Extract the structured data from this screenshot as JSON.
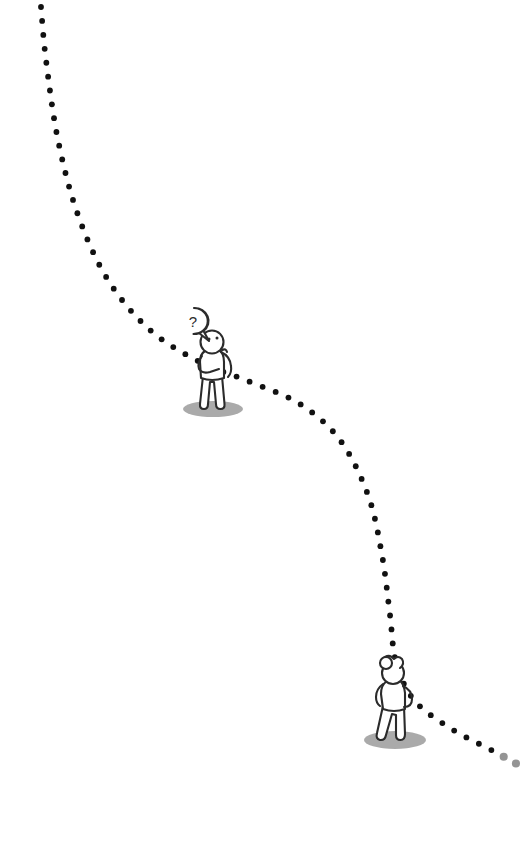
{
  "canvas": {
    "width": 529,
    "height": 849,
    "background_color": "#ffffff"
  },
  "illustration": {
    "title": "Dotted journey path with two stick figures",
    "style": "hand-drawn line art, monochrome",
    "ink_color": "#2b2b2b",
    "dot_color": "#111111",
    "shadow_color": "#8d8d8d"
  },
  "dotted_path": {
    "name": "journey-path",
    "dot_radius": 2.9,
    "dot_spacing": 14,
    "color": "#111111",
    "description": "A dotted trail entering at the top-left, sweeping down and right past a thinking figure, descending steeply, then curving past a second figure and exiting at the bottom-right edge.",
    "waypoints": [
      {
        "x": 41,
        "y": 7
      },
      {
        "x": 46,
        "y": 60
      },
      {
        "x": 58,
        "y": 140
      },
      {
        "x": 78,
        "y": 215
      },
      {
        "x": 108,
        "y": 280
      },
      {
        "x": 150,
        "y": 330
      },
      {
        "x": 200,
        "y": 362
      },
      {
        "x": 248,
        "y": 381
      },
      {
        "x": 300,
        "y": 404
      },
      {
        "x": 340,
        "y": 440
      },
      {
        "x": 368,
        "y": 495
      },
      {
        "x": 382,
        "y": 555
      },
      {
        "x": 390,
        "y": 615
      },
      {
        "x": 396,
        "y": 662
      },
      {
        "x": 414,
        "y": 700
      },
      {
        "x": 450,
        "y": 728
      },
      {
        "x": 495,
        "y": 752
      },
      {
        "x": 524,
        "y": 768
      }
    ],
    "fade_out_end": true
  },
  "figures": [
    {
      "id": "thinking-figure",
      "name": "figure-thinking",
      "label": "Person standing with hand on chin, thinking",
      "pose": "hand-to-chin",
      "position": {
        "x": 213,
        "y": 370
      },
      "has_speech_bubble": true,
      "speech_bubble": {
        "name": "question-speech-bubble",
        "text": "?",
        "shape": "round",
        "center": {
          "x": 194,
          "y": 322
        },
        "radius": 14,
        "tail_direction": "down-right"
      },
      "shadow": {
        "cx": 213,
        "cy": 409,
        "rx": 30,
        "ry": 8
      }
    },
    {
      "id": "hand-on-hip-figure",
      "name": "figure-hand-on-hip",
      "label": "Person standing with hand on hip, hair in a bun, looking back",
      "pose": "hand-on-hip",
      "position": {
        "x": 395,
        "y": 700
      },
      "hair": "bun",
      "has_speech_bubble": false,
      "shadow": {
        "cx": 395,
        "cy": 740,
        "rx": 31,
        "ry": 9
      }
    }
  ]
}
